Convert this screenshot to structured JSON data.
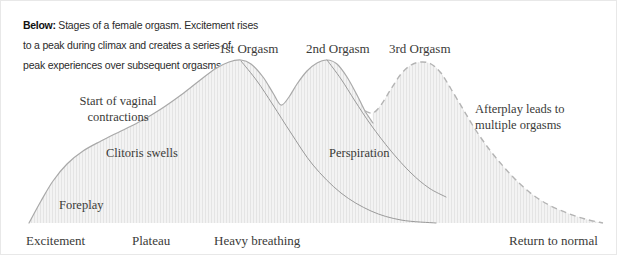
{
  "caption": {
    "lead": "Below:",
    "lines": [
      "Stages of a female orgasm. Excitement rises",
      "to a peak during climax and creates a series of",
      "peak experiences over subsequent orgasms."
    ]
  },
  "colors": {
    "fill": "#f1f1f1",
    "hatch": "#e2e2e2",
    "stroke": "#a9a9a9",
    "dashed_stroke": "#b4b4b4",
    "inner_line": "#9a9a9a",
    "text": "#3a3a38",
    "caption_text": "#2b2b2b",
    "border": "#e8e8e8",
    "background": "#ffffff"
  },
  "peak_labels": [
    {
      "text": "1st Orgasm",
      "x": 218,
      "y": 40
    },
    {
      "text": "2nd Orgasm",
      "x": 305,
      "y": 40
    },
    {
      "text": "3rd Orgasm",
      "x": 388,
      "y": 40
    }
  ],
  "inner_labels": [
    {
      "text_line1": "Start of vaginal",
      "text_line2": "contractions",
      "x": 57,
      "y": 92
    },
    {
      "text_line1": "Clitoris swells",
      "text_line2": "",
      "x": 105,
      "y": 145
    },
    {
      "text_line1": "Perspiration",
      "text_line2": "",
      "x": 328,
      "y": 145
    },
    {
      "text_line1": "Foreplay",
      "text_line2": "",
      "x": 58,
      "y": 197
    },
    {
      "text_line1": "Afterplay leads to",
      "text_line2": "multiple orgasms",
      "x": 474,
      "y": 100
    }
  ],
  "axis_labels": [
    {
      "text": "Excitement",
      "x": 25,
      "y": 232
    },
    {
      "text": "Plateau",
      "x": 131,
      "y": 232
    },
    {
      "text": "Heavy breathing",
      "x": 213,
      "y": 232
    },
    {
      "text": "Return to normal",
      "x": 508,
      "y": 232
    }
  ],
  "chart_data": {
    "type": "area",
    "title": "Stages of a female orgasm",
    "xlabel": "",
    "ylabel": "Arousal level",
    "grid": false,
    "legend": null,
    "baseline_y": 222,
    "x_range": [
      28,
      602
    ],
    "y_range": [
      58,
      222
    ],
    "phases": [
      "Excitement",
      "Plateau",
      "Heavy breathing",
      "Return to normal"
    ],
    "annotations": [
      "Start of vaginal contractions",
      "Clitoris swells",
      "Perspiration",
      "Foreplay",
      "Afterplay leads to multiple orgasms",
      "1st Orgasm",
      "2nd Orgasm",
      "3rd Orgasm"
    ],
    "series": [
      {
        "name": "Arousal curve (solid portion)",
        "style": "solid",
        "points": [
          [
            28,
            222
          ],
          [
            40,
            200
          ],
          [
            52,
            180
          ],
          [
            66,
            163
          ],
          [
            82,
            150
          ],
          [
            100,
            140
          ],
          [
            120,
            130
          ],
          [
            140,
            120
          ],
          [
            160,
            108
          ],
          [
            180,
            94
          ],
          [
            198,
            80
          ],
          [
            214,
            68
          ],
          [
            228,
            61
          ],
          [
            240,
            59
          ],
          [
            250,
            63
          ],
          [
            262,
            76
          ],
          [
            272,
            92
          ],
          [
            280,
            104
          ],
          [
            288,
            96
          ],
          [
            296,
            83
          ],
          [
            306,
            70
          ],
          [
            316,
            62
          ],
          [
            326,
            59
          ],
          [
            336,
            63
          ],
          [
            346,
            76
          ],
          [
            356,
            94
          ],
          [
            364,
            110
          ],
          [
            372,
            122
          ]
        ]
      },
      {
        "name": "Afterplay curve (dashed portion)",
        "style": "dashed",
        "points": [
          [
            364,
            110
          ],
          [
            372,
            112
          ],
          [
            380,
            104
          ],
          [
            390,
            88
          ],
          [
            400,
            73
          ],
          [
            410,
            64
          ],
          [
            420,
            61
          ],
          [
            430,
            63
          ],
          [
            440,
            72
          ],
          [
            450,
            88
          ],
          [
            462,
            108
          ],
          [
            474,
            128
          ],
          [
            488,
            148
          ],
          [
            502,
            165
          ],
          [
            516,
            180
          ],
          [
            532,
            194
          ],
          [
            548,
            204
          ],
          [
            566,
            212
          ],
          [
            584,
            218
          ],
          [
            602,
            222
          ]
        ]
      },
      {
        "name": "1st orgasm resolution line",
        "style": "solid-thin",
        "points": [
          [
            240,
            60
          ],
          [
            256,
            80
          ],
          [
            272,
            104
          ],
          [
            290,
            132
          ],
          [
            312,
            164
          ],
          [
            340,
            192
          ],
          [
            370,
            210
          ],
          [
            400,
            219
          ],
          [
            435,
            222
          ]
        ]
      },
      {
        "name": "2nd orgasm resolution line",
        "style": "solid-thin",
        "points": [
          [
            326,
            59
          ],
          [
            340,
            78
          ],
          [
            354,
            100
          ],
          [
            370,
            124
          ],
          [
            390,
            150
          ],
          [
            410,
            172
          ],
          [
            428,
            187
          ],
          [
            445,
            196
          ]
        ]
      }
    ]
  }
}
